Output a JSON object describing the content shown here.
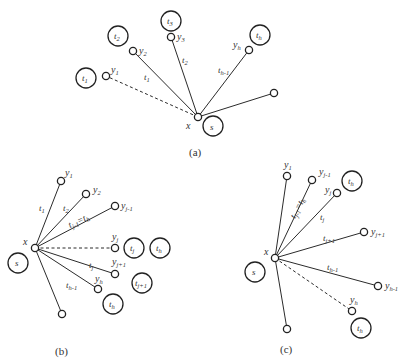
{
  "panels": [
    {
      "caption": "(a)",
      "center_label": "x",
      "source_label": "s",
      "terminals": [
        "t1",
        "t2",
        "t3",
        "th"
      ],
      "vertices": [
        "y1",
        "y2",
        "y3",
        "yh"
      ],
      "edge_labels": [
        "t1",
        "t2",
        "th-1"
      ],
      "dashed_edge": "x-y1"
    },
    {
      "caption": "(b)",
      "center_label": "x",
      "source_label": "s",
      "terminals": [
        "tj",
        "th",
        "tj+1",
        "th"
      ],
      "vertices": [
        "y1",
        "y2",
        "yj-1",
        "yj",
        "yj+1",
        "yh"
      ],
      "edge_labels": [
        "t1",
        "t2",
        "tj-1=th",
        "tj",
        "th-1"
      ],
      "dashed_edge": "x-yj"
    },
    {
      "caption": "(c)",
      "center_label": "x",
      "source_label": "s",
      "terminals": [
        "th",
        "th"
      ],
      "vertices": [
        "y1",
        "yj-1",
        "yj",
        "yj+1",
        "yh-1",
        "yh"
      ],
      "edge_labels": [
        "tj-1=th",
        "tj",
        "tj+1",
        "th-1"
      ],
      "dashed_edge": "x-yh"
    }
  ],
  "text": {
    "x": "x",
    "s": "s",
    "y": "y",
    "t": "t",
    "a": "(a)",
    "b": "(b)",
    "c": "(c)",
    "sub_1": "1",
    "sub_2": "2",
    "sub_3": "3",
    "sub_h": "h",
    "sub_hm1": "h-1",
    "sub_j": "j",
    "sub_jm1": "j-1",
    "sub_jp1": "j+1",
    "eq": "=t"
  }
}
